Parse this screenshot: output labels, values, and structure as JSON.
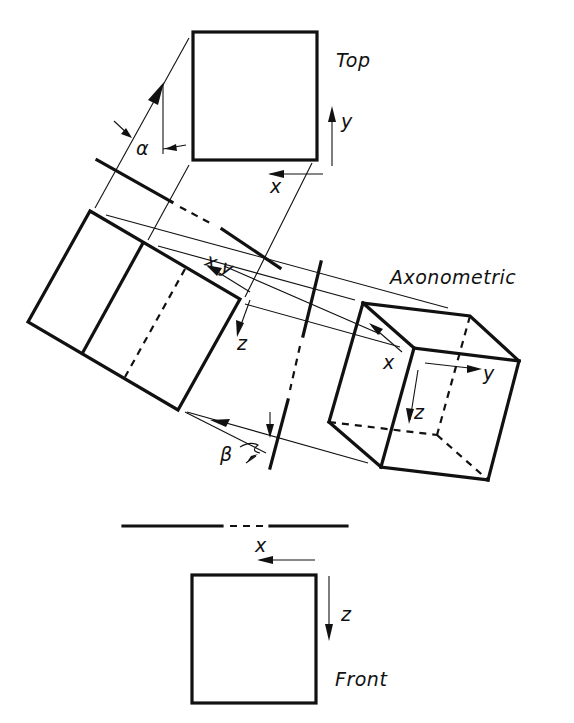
{
  "diagram": {
    "type": "orthographic-to-axonometric projection construction",
    "views": {
      "top": {
        "label": "Top",
        "axes": [
          "x",
          "y"
        ]
      },
      "axonometric": {
        "label": "Axonometric",
        "axes": [
          "x",
          "y",
          "z"
        ]
      },
      "front": {
        "label": "Front",
        "axes": [
          "x",
          "z"
        ]
      },
      "auxiliary": {
        "axes_label": "x,y",
        "z_label": "z"
      }
    },
    "angles": {
      "alpha": "α",
      "beta": "β"
    },
    "labels": {
      "top": "Top",
      "axonometric": "Axonometric",
      "front": "Front",
      "top_x": "x",
      "top_y": "y",
      "aux_xy": "x,y",
      "aux_z": "z",
      "axo_x": "x",
      "axo_y": "y",
      "axo_z": "z",
      "front_x": "x",
      "front_z": "z",
      "alpha": "α",
      "beta": "β"
    },
    "colors": {
      "ink": "#111111",
      "background": "#ffffff"
    }
  }
}
